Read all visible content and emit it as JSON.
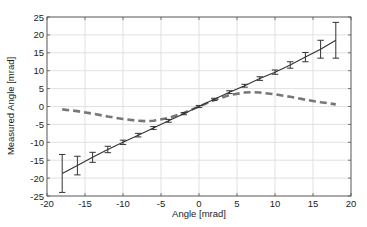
{
  "chart_data": {
    "type": "line",
    "title": "",
    "xlabel": "Angle [mrad]",
    "ylabel": "Measured Angle [mrad]",
    "xlim": [
      -20,
      20
    ],
    "ylim": [
      -25,
      25
    ],
    "xticks": [
      -20,
      -15,
      -10,
      -5,
      0,
      5,
      10,
      15,
      20
    ],
    "yticks": [
      -25,
      -20,
      -15,
      -10,
      -5,
      0,
      5,
      10,
      15,
      20,
      25
    ],
    "grid": true,
    "legend": null,
    "series": [
      {
        "name": "Measured (mean ± error)",
        "style": "solid-line-with-errorbars",
        "color": "#333333",
        "x": [
          -18,
          -16,
          -14,
          -12,
          -10,
          -8,
          -6,
          -4,
          -2,
          0,
          2,
          4,
          6,
          8,
          10,
          12,
          14,
          16,
          18
        ],
        "y": [
          -18.7,
          -16.5,
          -14.2,
          -12.0,
          -10.0,
          -8.0,
          -6.0,
          -4.0,
          -2.0,
          0.0,
          2.0,
          4.0,
          5.8,
          7.8,
          9.6,
          11.6,
          13.8,
          16.0,
          18.5
        ],
        "err": [
          5.3,
          2.6,
          1.4,
          0.9,
          0.6,
          0.5,
          0.4,
          0.4,
          0.3,
          0.3,
          0.3,
          0.4,
          0.4,
          0.5,
          0.6,
          0.9,
          1.3,
          2.5,
          5.0
        ]
      },
      {
        "name": "Deviation",
        "style": "dashed",
        "color": "#777777",
        "x": [
          -18,
          -16,
          -14,
          -12,
          -10,
          -8,
          -7,
          -6,
          -4,
          -2,
          0,
          2,
          4,
          6,
          7,
          8,
          10,
          12,
          14,
          16,
          18
        ],
        "y": [
          -0.8,
          -1.3,
          -2.0,
          -2.8,
          -3.5,
          -4.0,
          -4.1,
          -4.0,
          -3.2,
          -1.8,
          0.0,
          1.8,
          3.2,
          3.9,
          4.0,
          3.9,
          3.4,
          2.7,
          1.9,
          1.2,
          0.6
        ]
      }
    ]
  }
}
